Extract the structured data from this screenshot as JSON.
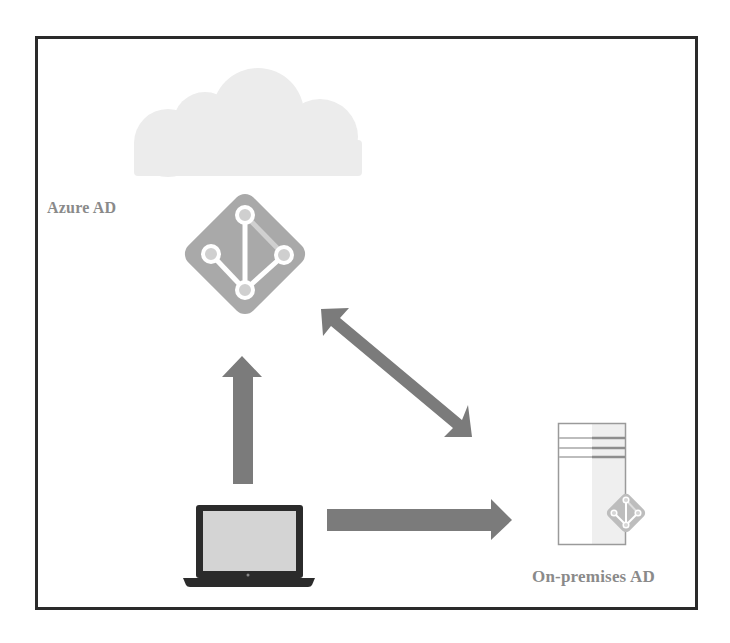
{
  "diagram": {
    "nodes": [
      {
        "id": "cloud",
        "label": "",
        "icon": "cloud-icon"
      },
      {
        "id": "azure-ad",
        "label": "Azure AD",
        "icon": "azure-ad-diamond-icon"
      },
      {
        "id": "laptop",
        "label": "",
        "icon": "laptop-icon"
      },
      {
        "id": "on-premises-ad",
        "label": "On-premises AD",
        "icon": "server-icon"
      }
    ],
    "edges": [
      {
        "from": "laptop",
        "to": "azure-ad",
        "direction": "one-way",
        "icon": "arrow-up-icon"
      },
      {
        "from": "laptop",
        "to": "on-premises-ad",
        "direction": "one-way",
        "icon": "arrow-right-icon"
      },
      {
        "from": "azure-ad",
        "to": "on-premises-ad",
        "direction": "two-way",
        "icon": "double-arrow-diagonal-icon"
      }
    ]
  },
  "labels": {
    "azure_ad": "Azure AD",
    "on_premises_ad": "On-premises AD"
  },
  "colors": {
    "frame_border": "#2a2a2a",
    "cloud_fill": "#ececec",
    "diamond_fill": "#a9a9a9",
    "node_inner": "#cfcfcf",
    "arrow_fill": "#7b7b7b",
    "laptop_body": "#2b2b2b",
    "laptop_screen": "#d4d4d4",
    "label_text": "#8a8a8a"
  }
}
